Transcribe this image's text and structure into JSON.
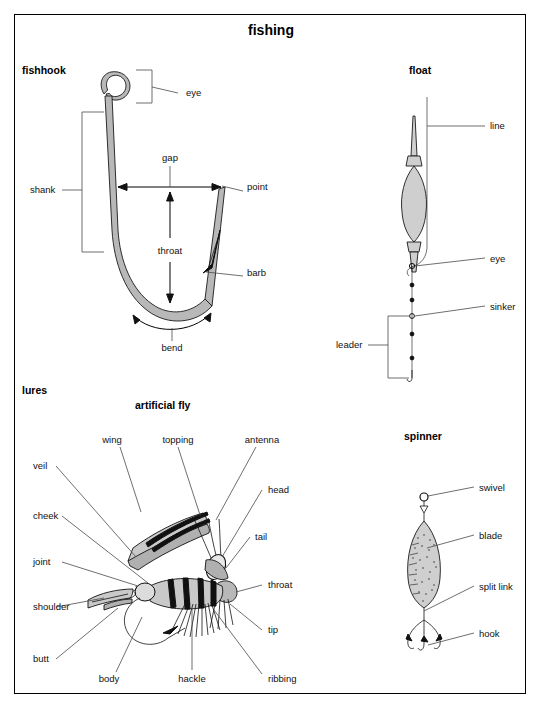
{
  "page": {
    "title": "fishing",
    "background": "#ffffff",
    "border_color": "#000000",
    "line_color": "#4a4a4a",
    "metal_fill": "#b8b8b8"
  },
  "sections": [
    {
      "id": "fishhook",
      "label": "fishhook"
    },
    {
      "id": "float",
      "label": "float"
    },
    {
      "id": "lures",
      "label": "lures"
    },
    {
      "id": "artificial_fly",
      "label": "artificial fly"
    },
    {
      "id": "spinner",
      "label": "spinner"
    }
  ],
  "fishhook": {
    "label": "fishhook",
    "parts": [
      {
        "name": "eye",
        "label": "eye",
        "x": 186,
        "y": 93
      },
      {
        "name": "shank",
        "label": "shank",
        "x": 30,
        "y": 190
      },
      {
        "name": "gap",
        "label": "gap",
        "x": 161,
        "y": 158
      },
      {
        "name": "point",
        "label": "point",
        "x": 249,
        "y": 187
      },
      {
        "name": "throat",
        "label": "throat",
        "x": 161,
        "y": 251
      },
      {
        "name": "barb",
        "label": "barb",
        "x": 249,
        "y": 272
      },
      {
        "name": "bend",
        "label": "bend",
        "x": 170,
        "y": 345
      }
    ]
  },
  "float": {
    "label": "float",
    "parts": [
      {
        "name": "line",
        "label": "line",
        "x": 492,
        "y": 128
      },
      {
        "name": "eye",
        "label": "eye",
        "x": 492,
        "y": 259
      },
      {
        "name": "sinker",
        "label": "sinker",
        "x": 492,
        "y": 307
      },
      {
        "name": "leader",
        "label": "leader",
        "x": 338,
        "y": 342
      }
    ]
  },
  "artificial_fly": {
    "label": "artificial fly",
    "group_label": "lures",
    "parts": [
      {
        "name": "wing",
        "label": "wing",
        "x": 112,
        "y": 440
      },
      {
        "name": "topping",
        "label": "topping",
        "x": 172,
        "y": 440
      },
      {
        "name": "antenna",
        "label": "antenna",
        "x": 253,
        "y": 440
      },
      {
        "name": "veil",
        "label": "veil",
        "x": 33,
        "y": 465
      },
      {
        "name": "cheek",
        "label": "cheek",
        "x": 268,
        "y": 490
      },
      {
        "name": "joint",
        "label": "joint",
        "x": 33,
        "y": 515
      },
      {
        "name": "shoulder",
        "label": "shoulder",
        "x": 253,
        "y": 537
      },
      {
        "name": "butt",
        "label": "butt",
        "x": 33,
        "y": 561
      },
      {
        "name": "head",
        "label": "head",
        "x": 268,
        "y": 584
      },
      {
        "name": "tail",
        "label": "tail",
        "x": 33,
        "y": 608
      },
      {
        "name": "throat",
        "label": "throat",
        "x": 268,
        "y": 632
      },
      {
        "name": "tip",
        "label": "tip",
        "x": 33,
        "y": 658
      },
      {
        "name": "ribbing",
        "label": "ribbing",
        "x": 109,
        "y": 681
      },
      {
        "name": "body",
        "label": "body",
        "x": 191,
        "y": 681
      },
      {
        "name": "hackle",
        "label": "hackle",
        "x": 265,
        "y": 681
      }
    ]
  },
  "spinner": {
    "label": "spinner",
    "parts": [
      {
        "name": "swivel",
        "label": "swivel",
        "x": 480,
        "y": 490
      },
      {
        "name": "blade",
        "label": "blade",
        "x": 480,
        "y": 537
      },
      {
        "name": "split_link",
        "label": "split link",
        "x": 480,
        "y": 588
      },
      {
        "name": "hook",
        "label": "hook",
        "x": 480,
        "y": 634
      }
    ]
  }
}
